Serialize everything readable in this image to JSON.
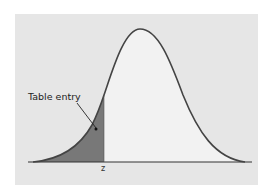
{
  "diagram": {
    "type": "standard-normal-density",
    "shaded_region": "left tail up to z",
    "annotation": "Table entry",
    "x_label": "z",
    "colors": {
      "background_panel": "#e6e6e6",
      "curve": "#444444",
      "shaded_area": "#777777",
      "unshaded_area": "#f0f0f0"
    }
  }
}
